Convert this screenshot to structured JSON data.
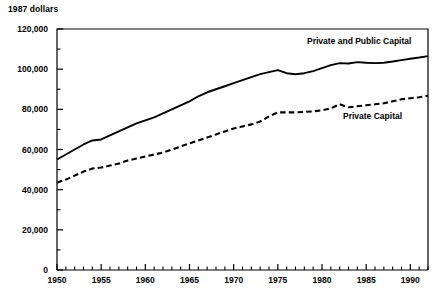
{
  "chart_data": {
    "type": "line",
    "title": "",
    "subtitle": "",
    "xlabel": "",
    "ylabel": "1987 dollars",
    "ylim": [
      0,
      120000
    ],
    "xlim": [
      1950,
      1992
    ],
    "grid": false,
    "legend_position": "inline-annotation",
    "y_ticks": [
      0,
      20000,
      40000,
      60000,
      80000,
      100000,
      120000
    ],
    "y_tick_labels": [
      "0",
      "20,000",
      "40,000",
      "60,000",
      "80,000",
      "100,000",
      "120,000"
    ],
    "y_minor_tick_interval": 10000,
    "x_ticks": [
      1950,
      1955,
      1960,
      1965,
      1970,
      1975,
      1980,
      1985,
      1990
    ],
    "x_tick_labels": [
      "1950",
      "1955",
      "1960",
      "1965",
      "1970",
      "1975",
      "1980",
      "1985",
      "1990"
    ],
    "x_minor_tick_interval": 1,
    "x": [
      1950,
      1951,
      1952,
      1953,
      1954,
      1955,
      1956,
      1957,
      1958,
      1959,
      1960,
      1961,
      1962,
      1963,
      1964,
      1965,
      1966,
      1967,
      1968,
      1969,
      1970,
      1971,
      1972,
      1973,
      1974,
      1975,
      1976,
      1977,
      1978,
      1979,
      1980,
      1981,
      1982,
      1983,
      1984,
      1985,
      1986,
      1987,
      1988,
      1989,
      1990,
      1991,
      1992
    ],
    "series": [
      {
        "name": "Private and Public Capital",
        "style": "solid",
        "color": "#000000",
        "annotation": "Private and Public Capital",
        "values": [
          55000,
          57500,
          60000,
          62500,
          64500,
          65000,
          67000,
          69000,
          71000,
          73000,
          74500,
          76000,
          78000,
          80000,
          82000,
          84000,
          86500,
          88500,
          90000,
          91500,
          93000,
          94500,
          96000,
          97500,
          98500,
          99500,
          98000,
          97500,
          98000,
          99000,
          100500,
          102000,
          103000,
          102800,
          103500,
          103200,
          103000,
          103200,
          103800,
          104500,
          105200,
          105800,
          106500
        ]
      },
      {
        "name": "Private Capital",
        "style": "dashed",
        "color": "#000000",
        "annotation": "Private Capital",
        "values": [
          43500,
          45000,
          47000,
          49000,
          50500,
          51000,
          52000,
          53000,
          54500,
          55500,
          56500,
          57500,
          58500,
          60000,
          61500,
          63000,
          64500,
          66000,
          67500,
          69000,
          70500,
          71500,
          72500,
          74000,
          76500,
          78500,
          78500,
          78500,
          78700,
          79000,
          79500,
          80500,
          82500,
          81000,
          81500,
          82000,
          82500,
          83000,
          84000,
          85000,
          85500,
          86000,
          86800
        ]
      }
    ]
  },
  "plot_frame": {
    "left": 57,
    "top": 29,
    "right": 428,
    "bottom": 270
  },
  "annotations": {
    "private_and_public_capital": {
      "text": "Private and Public Capital",
      "x": 307,
      "y": 42
    },
    "private_capital": {
      "text": "Private Capital",
      "x": 343,
      "y": 117
    }
  },
  "colors": {
    "axis": "#000000",
    "line": "#000000",
    "background": "#ffffff"
  }
}
